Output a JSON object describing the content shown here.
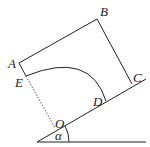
{
  "diagram": {
    "labels": {
      "A": "A",
      "B": "B",
      "C": "C",
      "D": "D",
      "E": "E",
      "O": "O",
      "alpha": "α"
    },
    "colors": {
      "stroke": "#222222",
      "dotted": "#555555",
      "background": "#ffffff"
    }
  }
}
